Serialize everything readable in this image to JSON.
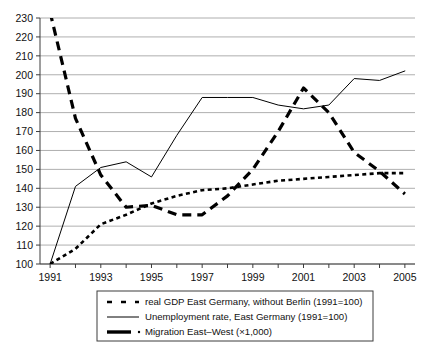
{
  "chart_data": {
    "type": "line",
    "title": "",
    "subtitle": "",
    "xlabel": "",
    "ylabel": "",
    "xlim": [
      1990.6,
      2005.4
    ],
    "ylim": [
      100,
      230
    ],
    "grid": true,
    "legend_position": "bottom",
    "x": [
      1991,
      1992,
      1993,
      1994,
      1995,
      1996,
      1997,
      1998,
      1999,
      2000,
      2001,
      2002,
      2003,
      2004,
      2005
    ],
    "ytick_labels": [
      "100",
      "110",
      "120",
      "130",
      "140",
      "150",
      "160",
      "170",
      "180",
      "190",
      "200",
      "210",
      "220",
      "230"
    ],
    "ytick_values": [
      100,
      110,
      120,
      130,
      140,
      150,
      160,
      170,
      180,
      190,
      200,
      210,
      220,
      230
    ],
    "xtick_values": [
      1991,
      1992,
      1993,
      1994,
      1995,
      1996,
      1997,
      1998,
      1999,
      2000,
      2001,
      2002,
      2003,
      2004,
      2005
    ],
    "xtick_labels": [
      "1991",
      "",
      "1993",
      "",
      "1995",
      "",
      "1997",
      "",
      "1999",
      "",
      "2001",
      "",
      "2003",
      "",
      "2005"
    ],
    "xtick_labels_visible": [
      "1991",
      "1993",
      "1995",
      "1997",
      "1999",
      "2001",
      "2003",
      "2005"
    ],
    "series": [
      {
        "name": "real GDP East Germany, without Berlin (1991=100)",
        "style": "dotted",
        "color": "#000000",
        "values": [
          100,
          108,
          121,
          126,
          132,
          136,
          139,
          140,
          142,
          144,
          145,
          146,
          147,
          148,
          148
        ]
      },
      {
        "name": "Unemployment rate, East Germany (1991=100)",
        "style": "solid",
        "color": "#000000",
        "values": [
          100,
          141,
          151,
          154,
          146,
          168,
          188,
          188,
          188,
          184,
          182,
          184,
          198,
          197,
          202
        ]
      },
      {
        "name": "Migration East–West (×1,000)",
        "style": "thick-dashed",
        "color": "#000000",
        "values": [
          233,
          177,
          147,
          130,
          131,
          126,
          126,
          136,
          150,
          170,
          193,
          180,
          159,
          149,
          137
        ]
      }
    ]
  },
  "legend": {
    "items": [
      {
        "label": "real GDP East Germany, without Berlin (1991=100)",
        "marker": "dotted-marker"
      },
      {
        "label": "Unemployment rate, East Germany (1991=100)",
        "marker": "solid-marker"
      },
      {
        "label": "Migration East–West (×1,000)",
        "marker": "thick-dash-dot-marker"
      }
    ]
  }
}
